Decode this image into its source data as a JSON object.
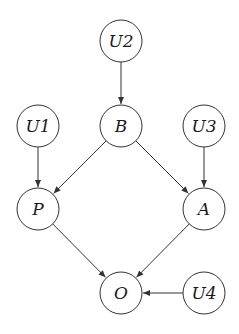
{
  "diagram": {
    "type": "directed-acyclic-graph",
    "stroke_color": "#333333",
    "node_radius": 21,
    "nodes": [
      {
        "id": "U2",
        "label": "U2",
        "x": 121,
        "y": 41
      },
      {
        "id": "U1",
        "label": "U1",
        "x": 38,
        "y": 126
      },
      {
        "id": "B",
        "label": "B",
        "x": 121,
        "y": 126
      },
      {
        "id": "U3",
        "label": "U3",
        "x": 204,
        "y": 126
      },
      {
        "id": "P",
        "label": "P",
        "x": 38,
        "y": 209
      },
      {
        "id": "A",
        "label": "A",
        "x": 204,
        "y": 209
      },
      {
        "id": "O",
        "label": "O",
        "x": 121,
        "y": 293
      },
      {
        "id": "U4",
        "label": "U4",
        "x": 204,
        "y": 293
      }
    ],
    "edges": [
      {
        "from": "U2",
        "to": "B"
      },
      {
        "from": "U1",
        "to": "P"
      },
      {
        "from": "B",
        "to": "P"
      },
      {
        "from": "B",
        "to": "A"
      },
      {
        "from": "U3",
        "to": "A"
      },
      {
        "from": "P",
        "to": "O"
      },
      {
        "from": "A",
        "to": "O"
      },
      {
        "from": "U4",
        "to": "O"
      }
    ]
  }
}
